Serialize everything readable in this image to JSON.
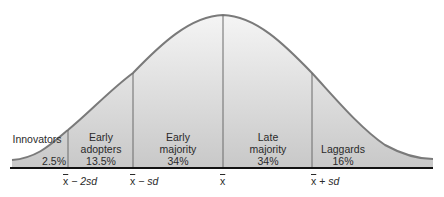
{
  "diagram": {
    "colors": {
      "curve": "#7a7a7a",
      "divider": "#6a6a6a",
      "baseline": "#111111",
      "fill_top": "#f4f4f4",
      "fill_bottom": "#c9c9c9",
      "text": "#2a2a2a"
    },
    "segments": [
      {
        "name": "Innovators",
        "lines": [
          "Innovators"
        ],
        "percent": "2.5%"
      },
      {
        "name": "Early adopters",
        "lines": [
          "Early",
          "adopters"
        ],
        "percent": "13.5%"
      },
      {
        "name": "Early majority",
        "lines": [
          "Early",
          "majority"
        ],
        "percent": "34%"
      },
      {
        "name": "Late majority",
        "lines": [
          "Late",
          "majority"
        ],
        "percent": "34%"
      },
      {
        "name": "Laggards",
        "lines": [
          "Laggards"
        ],
        "percent": "16%"
      }
    ],
    "axis_labels": [
      {
        "mean": "x",
        "op": " − ",
        "term": "2sd"
      },
      {
        "mean": "x",
        "op": " − ",
        "term": "sd"
      },
      {
        "mean": "x",
        "op": "",
        "term": ""
      },
      {
        "mean": "x",
        "op": " + ",
        "term": "sd"
      }
    ]
  }
}
